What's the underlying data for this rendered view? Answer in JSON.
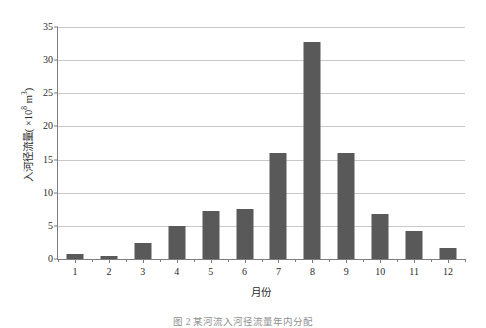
{
  "chart_data": {
    "type": "bar",
    "title": "",
    "categories": [
      "1",
      "2",
      "3",
      "4",
      "5",
      "6",
      "7",
      "8",
      "9",
      "10",
      "11",
      "12"
    ],
    "values": [
      0.8,
      0.5,
      2.4,
      5.0,
      7.3,
      7.6,
      16.0,
      32.8,
      16.0,
      6.8,
      4.2,
      1.7
    ],
    "xlabel": "月份",
    "ylabel": "入河径流量(×10⁸ m³)",
    "ylabel_main": "入河径流量( ×10",
    "ylabel_exponent": "8",
    "ylabel_unit": " m",
    "ylabel_unit_exponent": "3",
    "ylabel_close": ")",
    "ylim": [
      0,
      35
    ],
    "ytick_labels": [
      "0",
      "5",
      "10",
      "15",
      "20",
      "25",
      "30",
      "35"
    ],
    "ytick_values": [
      0,
      5,
      10,
      15,
      20,
      25,
      30,
      35
    ],
    "grid": true,
    "legend": "none",
    "bar_color": "#595959",
    "gridline_color": "#c9c9c9",
    "axis_color": "#7d7d7d",
    "background": "#ffffff"
  },
  "caption": {
    "text": "图 2  某河流入河径流量年内分配"
  }
}
